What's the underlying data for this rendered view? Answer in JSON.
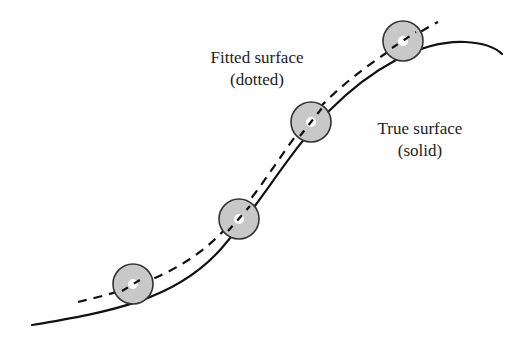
{
  "diagram": {
    "labels": {
      "fitted_line1": "Fitted surface",
      "fitted_line2": "(dotted)",
      "true_line1": "True surface",
      "true_line2": "(solid)"
    },
    "curves": {
      "true_surface": {
        "style": "solid",
        "color": "#111111"
      },
      "fitted_surface": {
        "style": "dashed",
        "color": "#111111"
      }
    },
    "balls": [
      {
        "cx": 133,
        "cy": 284,
        "r": 20
      },
      {
        "cx": 239,
        "cy": 219,
        "r": 20
      },
      {
        "cx": 311,
        "cy": 122,
        "r": 20
      },
      {
        "cx": 403,
        "cy": 41,
        "r": 20
      }
    ],
    "colors": {
      "ball_fill": "#c8c8c8",
      "ball_stroke": "#333333",
      "ball_center": "#ffffff"
    }
  }
}
